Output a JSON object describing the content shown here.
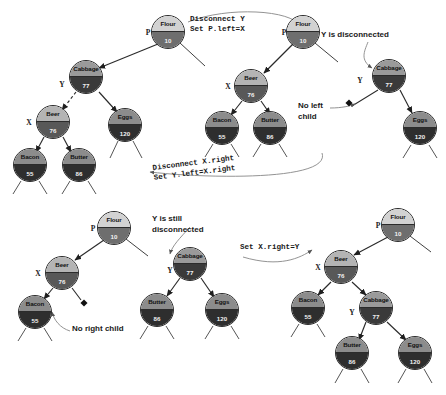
{
  "figure": {
    "panels": [
      {
        "id": "panel-1",
        "name": "before",
        "nodes": [
          {
            "key": "p1-flour",
            "name": "Flour",
            "value": "10",
            "tone": "t-light",
            "x": 168,
            "y": 32
          },
          {
            "key": "p1-cabbage",
            "name": "Cabbage",
            "value": "77",
            "tone": "t-dark",
            "x": 86,
            "y": 77
          },
          {
            "key": "p1-beer",
            "name": "Beer",
            "value": "76",
            "tone": "t-mid",
            "x": 53,
            "y": 122
          },
          {
            "key": "p1-eggs",
            "name": "Eggs",
            "value": "120",
            "tone": "t-deep",
            "x": 125,
            "y": 125
          },
          {
            "key": "p1-bacon",
            "name": "Bacon",
            "value": "55",
            "tone": "t-deep",
            "x": 30,
            "y": 165
          },
          {
            "key": "p1-butter",
            "name": "Butter",
            "value": "86",
            "tone": "t-deep",
            "x": 79,
            "y": 165
          }
        ],
        "pointers": [
          {
            "label": "P",
            "x": 148,
            "y": 32
          },
          {
            "label": "Y",
            "x": 62,
            "y": 84
          },
          {
            "label": "X",
            "x": 29,
            "y": 122
          }
        ]
      },
      {
        "id": "panel-2",
        "name": "after-disconnect-y",
        "nodes": [
          {
            "key": "p2-flour",
            "name": "Flour",
            "value": "10",
            "tone": "t-light",
            "x": 303,
            "y": 32
          },
          {
            "key": "p2-beer",
            "name": "Beer",
            "value": "76",
            "tone": "t-mid",
            "x": 251,
            "y": 86
          },
          {
            "key": "p2-bacon",
            "name": "Bacon",
            "value": "55",
            "tone": "t-deep",
            "x": 222,
            "y": 128
          },
          {
            "key": "p2-butter",
            "name": "Butter",
            "value": "86",
            "tone": "t-deep",
            "x": 270,
            "y": 128
          },
          {
            "key": "p2-cabbage",
            "name": "Cabbage",
            "value": "77",
            "tone": "t-dark",
            "x": 389,
            "y": 76
          },
          {
            "key": "p2-eggs",
            "name": "Eggs",
            "value": "120",
            "tone": "t-deep",
            "x": 420,
            "y": 128
          }
        ],
        "pointers": [
          {
            "label": "P",
            "x": 284,
            "y": 32
          },
          {
            "label": "X",
            "x": 228,
            "y": 86
          },
          {
            "label": "Y",
            "x": 360,
            "y": 80
          }
        ]
      },
      {
        "id": "panel-3",
        "name": "after-disconnect-x-right",
        "nodes": [
          {
            "key": "p3-flour",
            "name": "Flour",
            "value": "10",
            "tone": "t-light",
            "x": 114,
            "y": 228
          },
          {
            "key": "p3-beer",
            "name": "Beer",
            "value": "76",
            "tone": "t-mid",
            "x": 62,
            "y": 273
          },
          {
            "key": "p3-bacon",
            "name": "Bacon",
            "value": "55",
            "tone": "t-deep",
            "x": 35,
            "y": 312
          },
          {
            "key": "p3-cabbage",
            "name": "Cabbage",
            "value": "77",
            "tone": "t-dark",
            "x": 190,
            "y": 264
          },
          {
            "key": "p3-butter",
            "name": "Butter",
            "value": "86",
            "tone": "t-deep",
            "x": 157,
            "y": 310
          },
          {
            "key": "p3-eggs",
            "name": "Eggs",
            "value": "120",
            "tone": "t-deep",
            "x": 222,
            "y": 310
          }
        ],
        "pointers": [
          {
            "label": "P",
            "x": 93,
            "y": 228
          },
          {
            "label": "X",
            "x": 38,
            "y": 273
          },
          {
            "label": "Y",
            "x": 170,
            "y": 270
          }
        ]
      },
      {
        "id": "panel-4",
        "name": "after-set-x-right",
        "nodes": [
          {
            "key": "p4-flour",
            "name": "Flour",
            "value": "10",
            "tone": "t-light",
            "x": 398,
            "y": 225
          },
          {
            "key": "p4-beer",
            "name": "Beer",
            "value": "76",
            "tone": "t-mid",
            "x": 341,
            "y": 267
          },
          {
            "key": "p4-bacon",
            "name": "Bacon",
            "value": "55",
            "tone": "t-deep",
            "x": 308,
            "y": 308
          },
          {
            "key": "p4-cabbage",
            "name": "Cabbage",
            "value": "77",
            "tone": "t-dark",
            "x": 376,
            "y": 308
          },
          {
            "key": "p4-butter",
            "name": "Butter",
            "value": "86",
            "tone": "t-deep",
            "x": 352,
            "y": 353
          },
          {
            "key": "p4-eggs",
            "name": "Eggs",
            "value": "120",
            "tone": "t-deep",
            "x": 415,
            "y": 353
          }
        ],
        "pointers": [
          {
            "label": "P",
            "x": 378,
            "y": 225
          },
          {
            "label": "X",
            "x": 318,
            "y": 267
          },
          {
            "label": "Y",
            "x": 352,
            "y": 312
          }
        ]
      }
    ],
    "annotations": [
      {
        "key": "ann-disconnect-y",
        "text": "Disconnect Y\nSet P.left=X",
        "x": 190,
        "y": 14,
        "style": "mono",
        "rot": 0
      },
      {
        "key": "ann-y-disconnected",
        "text": "Y is disconnected",
        "x": 321,
        "y": 30,
        "style": "plain",
        "rot": 0
      },
      {
        "key": "ann-no-left-child",
        "text": "No left\nchild",
        "x": 298,
        "y": 101,
        "style": "plain",
        "rot": 0
      },
      {
        "key": "ann-disconnect-x-right",
        "text": "Disconnect X.right\nSet Y.left=X.right",
        "x": 152,
        "y": 163,
        "style": "mono",
        "rot": -7
      },
      {
        "key": "ann-y-still-disconnected",
        "text": "Y is still\ndisconnected",
        "x": 152,
        "y": 214,
        "style": "plain",
        "rot": 0
      },
      {
        "key": "ann-no-right-child",
        "text": "No right child",
        "x": 72,
        "y": 324,
        "style": "plain",
        "rot": 0
      },
      {
        "key": "ann-set-x-right",
        "text": "Set X.right=Y",
        "x": 240,
        "y": 242,
        "style": "mono",
        "rot": 0
      }
    ]
  }
}
